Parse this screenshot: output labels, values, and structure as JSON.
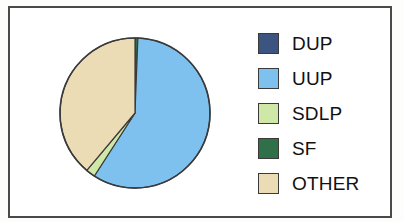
{
  "frame": {
    "border_color": "#4a4a4a",
    "background": "#ffffff"
  },
  "legend": {
    "position": "right",
    "items": [
      {
        "label": "DUP",
        "color": "#3b5580",
        "swatch_name": "legend-swatch-dup"
      },
      {
        "label": "UUP",
        "color": "#7ec1ef",
        "swatch_name": "legend-swatch-uup"
      },
      {
        "label": "SDLP",
        "color": "#cfe8a8",
        "swatch_name": "legend-swatch-sdlp"
      },
      {
        "label": "SF",
        "color": "#2f7048",
        "swatch_name": "legend-swatch-sf"
      },
      {
        "label": "OTHER",
        "color": "#ecdcb5",
        "swatch_name": "legend-swatch-other"
      }
    ]
  },
  "chart_data": {
    "type": "pie",
    "title": "",
    "subtitle": "",
    "xlabel": "",
    "ylabel": "",
    "grid": false,
    "legend_position": "right",
    "start_angle_deg": 0,
    "direction": "clockwise",
    "center": {
      "x": 125,
      "y": 105
    },
    "radius": 75,
    "slice_border_color": "#3a3a3a",
    "categories": [
      "DUP",
      "UUP",
      "SDLP",
      "SF",
      "OTHER"
    ],
    "values": [
      0,
      58.5,
      2.0,
      0.6,
      38.9
    ],
    "units": "percent",
    "colors": [
      "#3b5580",
      "#7ec1ef",
      "#cfe8a8",
      "#2f7048",
      "#ecdcb5"
    ],
    "slices": [
      {
        "label": "DUP",
        "value": 0,
        "percent": 0.0,
        "color": "#3b5580",
        "start_deg": 0.0,
        "end_deg": 0.0
      },
      {
        "label": "SF",
        "value": 0.6,
        "percent": 0.6,
        "color": "#2f7048",
        "start_deg": 0.0,
        "end_deg": 2.2
      },
      {
        "label": "UUP",
        "value": 58.5,
        "percent": 58.5,
        "color": "#7ec1ef",
        "start_deg": 2.2,
        "end_deg": 212.8
      },
      {
        "label": "SDLP",
        "value": 2.0,
        "percent": 2.0,
        "color": "#cfe8a8",
        "start_deg": 212.8,
        "end_deg": 220.0
      },
      {
        "label": "OTHER",
        "value": 38.9,
        "percent": 38.9,
        "color": "#ecdcb5",
        "start_deg": 220.0,
        "end_deg": 360.0
      }
    ]
  }
}
